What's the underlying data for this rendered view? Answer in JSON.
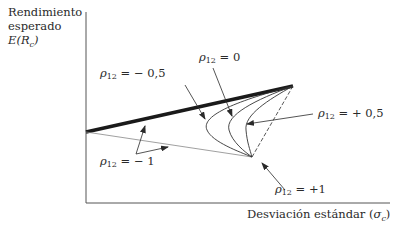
{
  "axes": {
    "y_label_line1": "Rendimiento",
    "y_label_line2": "esperado",
    "y_label_symbol": "E(R",
    "y_label_sub": "c",
    "y_label_close": ")",
    "x_label_text": "Desviación estándar (",
    "x_label_symbol": "σ",
    "x_label_sub": "c",
    "x_label_close": ")"
  },
  "labels": {
    "rho_m05": {
      "sym": "ρ",
      "sub": "12",
      "val": " = − 0,5"
    },
    "rho_0": {
      "sym": "ρ",
      "sub": "12",
      "val": " = 0"
    },
    "rho_p05": {
      "sym": "ρ",
      "sub": "12",
      "val": " = + 0,5"
    },
    "rho_m1": {
      "sym": "ρ",
      "sub": "12",
      "val": " = − 1"
    },
    "rho_p1": {
      "sym": "ρ",
      "sub": "12",
      "val": " = +1"
    }
  },
  "colors": {
    "ink": "#2a2a2a",
    "thick_line": "#1a1a1a",
    "thin_line": "#777777"
  }
}
